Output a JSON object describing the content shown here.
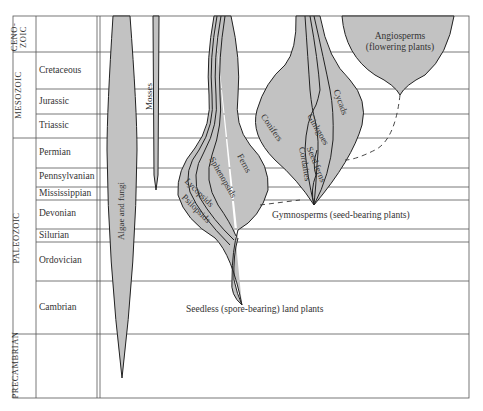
{
  "eras": [
    {
      "name": "Cenozoic",
      "display": "Ceno-\nzoic",
      "periods": [
        ""
      ]
    },
    {
      "name": "Mesozoic",
      "display": "Mesozoic",
      "periods": [
        "Cretaceous",
        "Jurassic",
        "Triassic"
      ]
    },
    {
      "name": "Paleozoic",
      "display": "Paleozoic",
      "periods": [
        "Permian",
        "Pennsylvanian",
        "Mississippian",
        "Devonian",
        "Silurian",
        "Ordovician",
        "Cambrian"
      ]
    },
    {
      "name": "Precambrian",
      "display": "Precambrian",
      "periods": [
        ""
      ]
    }
  ],
  "labels": {
    "cenozoic_1": "Ceno-",
    "cenozoic_2": "zoic",
    "mesozoic": "Mesozoic",
    "paleozoic": "Paleozoic",
    "precambrian": "Precambrian",
    "cretaceous": "Cretaceous",
    "jurassic": "Jurassic",
    "triassic": "Triassic",
    "permian": "Permian",
    "pennsylvanian": "Pennsylvanian",
    "mississippian": "Mississippian",
    "devonian": "Devonian",
    "silurian": "Silurian",
    "ordovician": "Ordovician",
    "cambrian": "Cambrian"
  },
  "groups": {
    "algae": "Algae and fungi",
    "mosses": "Mosses",
    "ferns": "Ferns",
    "sphenopsids": "Sphenopsids",
    "lycopsids": "Lycopsids",
    "psilopsids": "Psilopsids",
    "conifers": "Conifers",
    "ginkgoes": "Ginkgoes",
    "cycads": "Cycads",
    "seed_ferns": "Seed ferns",
    "cordaites": "Cordaites",
    "angiosperms_1": "Angiosperms",
    "angiosperms_2": "(flowering plants)"
  },
  "annotations": {
    "gymnosperms": "Gymnosperms  (seed-bearing plants)",
    "seedless": "Seedless  (spore-bearing)  land plants"
  },
  "colors": {
    "fill": "#c2c2c2",
    "stroke": "#222222",
    "grid": "#555555"
  }
}
